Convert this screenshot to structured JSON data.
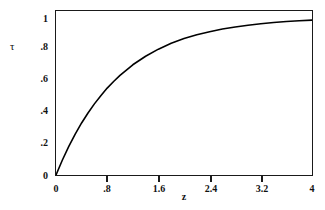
{
  "chart_data": {
    "type": "line",
    "title": "",
    "xlabel": "z",
    "ylabel": "τ",
    "xlim": [
      0,
      4
    ],
    "ylim": [
      0,
      1.04
    ],
    "grid": false,
    "legend": null,
    "xticks": [
      {
        "value": 0,
        "label": "0"
      },
      {
        "value": 0.8,
        "label": ".8"
      },
      {
        "value": 1.6,
        "label": "1.6"
      },
      {
        "value": 2.4,
        "label": "2.4"
      },
      {
        "value": 3.2,
        "label": "3.2"
      },
      {
        "value": 4,
        "label": "4"
      }
    ],
    "yticks": [
      {
        "value": 0,
        "label": "0"
      },
      {
        "value": 0.2,
        "label": ".2"
      },
      {
        "value": 0.4,
        "label": ".4"
      },
      {
        "value": 0.6,
        "label": ".6"
      },
      {
        "value": 0.8,
        "label": ".8"
      },
      {
        "value": 1.0,
        "label": "1"
      }
    ],
    "series": [
      {
        "name": "tau",
        "color": "#000000",
        "x": [
          0,
          0.1,
          0.2,
          0.3,
          0.4,
          0.5,
          0.6,
          0.7,
          0.8,
          0.9,
          1.0,
          1.2,
          1.4,
          1.6,
          1.8,
          2.0,
          2.2,
          2.4,
          2.6,
          2.8,
          3.0,
          3.2,
          3.4,
          3.6,
          3.8,
          4.0
        ],
        "y": [
          0,
          0.095,
          0.181,
          0.259,
          0.33,
          0.393,
          0.451,
          0.503,
          0.551,
          0.593,
          0.632,
          0.699,
          0.753,
          0.798,
          0.835,
          0.865,
          0.889,
          0.909,
          0.926,
          0.939,
          0.95,
          0.959,
          0.967,
          0.973,
          0.978,
          0.982
        ]
      }
    ]
  }
}
